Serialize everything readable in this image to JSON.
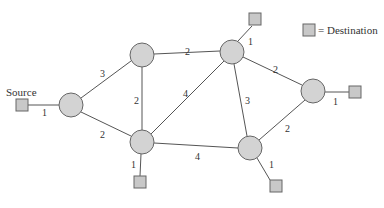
{
  "legend": {
    "label": "= Destination"
  },
  "source": {
    "label": "Source",
    "edge_weight": "1"
  },
  "nodes": [
    {
      "id": "A",
      "cx": 71,
      "cy": 105
    },
    {
      "id": "B",
      "cx": 142,
      "cy": 55
    },
    {
      "id": "C",
      "cx": 232,
      "cy": 52
    },
    {
      "id": "D",
      "cx": 313,
      "cy": 91
    },
    {
      "id": "E",
      "cx": 142,
      "cy": 142
    },
    {
      "id": "F",
      "cx": 250,
      "cy": 148
    }
  ],
  "edges": [
    {
      "from": "A",
      "to": "B",
      "weight": "3"
    },
    {
      "from": "A",
      "to": "E",
      "weight": "2"
    },
    {
      "from": "B",
      "to": "C",
      "weight": "2"
    },
    {
      "from": "B",
      "to": "E",
      "weight": "2"
    },
    {
      "from": "E",
      "to": "C",
      "weight": "4"
    },
    {
      "from": "E",
      "to": "F",
      "weight": "4"
    },
    {
      "from": "C",
      "to": "F",
      "weight": "3"
    },
    {
      "from": "C",
      "to": "D",
      "weight": "2"
    },
    {
      "from": "F",
      "to": "D",
      "weight": "2"
    }
  ],
  "destinations": [
    {
      "attached_to": "C",
      "weight": "1"
    },
    {
      "attached_to": "D",
      "weight": "1"
    },
    {
      "attached_to": "E",
      "weight": "1"
    },
    {
      "attached_to": "F",
      "weight": "1"
    }
  ]
}
